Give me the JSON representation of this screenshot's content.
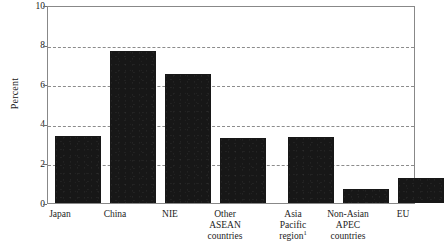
{
  "chart_data": {
    "type": "bar",
    "title": "",
    "xlabel": "",
    "ylabel": "Percent",
    "ylim": [
      0,
      10
    ],
    "yticks": [
      0,
      2,
      4,
      6,
      8,
      10
    ],
    "grid": true,
    "gridlines_at": [
      2,
      4,
      6,
      8
    ],
    "legend": "none",
    "categories": [
      "Japan",
      "China",
      "NIE",
      "Other ASEAN countries",
      "Asia Pacific region",
      "Non-Asian APEC countries",
      "EU"
    ],
    "values": [
      3.4,
      7.75,
      6.6,
      3.3,
      3.35,
      0.7,
      1.3
    ],
    "annotations": [
      "1"
    ],
    "bar_color": "#171717"
  },
  "axes": {
    "y_title": "Percent",
    "y_tick_labels": [
      "10",
      "8",
      "6",
      "4",
      "2",
      "0"
    ]
  },
  "categories": [
    {
      "lines": [
        "Japan"
      ],
      "sup": ""
    },
    {
      "lines": [
        "China"
      ],
      "sup": ""
    },
    {
      "lines": [
        "NIE"
      ],
      "sup": ""
    },
    {
      "lines": [
        "Other",
        "ASEAN",
        "countries"
      ],
      "sup": ""
    },
    {
      "lines": [
        "Asia",
        "Pacific",
        "region"
      ],
      "sup": "1"
    },
    {
      "lines": [
        "Non-Asian",
        "APEC",
        "countries"
      ],
      "sup": ""
    },
    {
      "lines": [
        "EU"
      ],
      "sup": ""
    }
  ]
}
